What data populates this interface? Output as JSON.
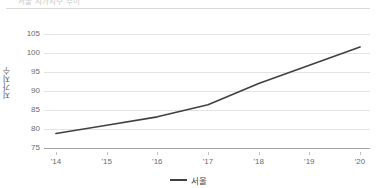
{
  "header": {
    "title": "서울 지가지수 추이",
    "visible_fragment": true
  },
  "legend": {
    "position": "bottom-center",
    "items": [
      {
        "label": "서울",
        "color": "#404040",
        "marker": "line-swatch"
      }
    ]
  },
  "chart_data": {
    "type": "line",
    "title": "",
    "xlabel": "",
    "ylabel": "지가지수",
    "categories": [
      "'14",
      "'15",
      "'16",
      "'17",
      "'18",
      "'19",
      "'20"
    ],
    "series": [
      {
        "name": "서울",
        "color": "#404040",
        "values": [
          78.8,
          81.0,
          83.2,
          86.4,
          92.0,
          96.8,
          101.6
        ]
      }
    ],
    "ylim": [
      75,
      107
    ],
    "y_ticks": [
      75,
      80,
      85,
      90,
      95,
      100,
      105
    ],
    "y_tick_labels": [
      "75",
      "80",
      "85",
      "90",
      "95",
      "100",
      "105"
    ],
    "x_tick_labels": [
      "'14",
      "'15",
      "'16",
      "'17",
      "'18",
      "'19",
      "'20"
    ],
    "grid": "horizontal",
    "legend_position": "bottom",
    "line_width": 1.6,
    "markers": false,
    "axis_color": "#a6a6a6",
    "grid_color": "#e4e4e4",
    "tick_text_color": "#6b6b6b"
  }
}
